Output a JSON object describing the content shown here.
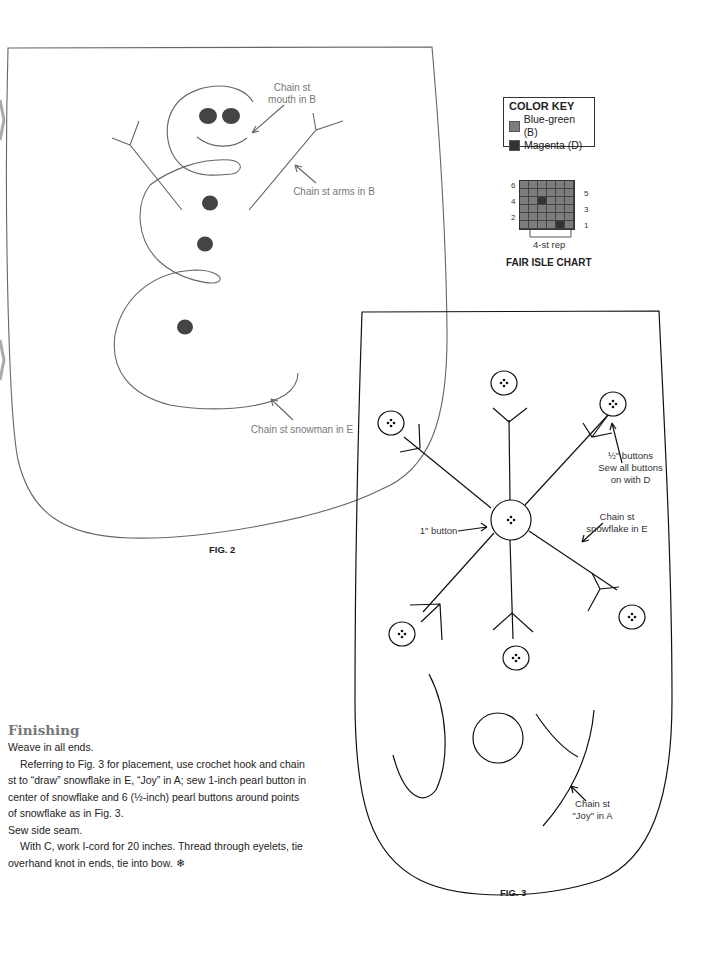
{
  "color_key": {
    "title": "COLOR KEY",
    "items": [
      {
        "label": "Blue-green (B)",
        "color": "#7d7d7d"
      },
      {
        "label": "Magenta (D)",
        "color": "#333333"
      }
    ]
  },
  "fair_isle_chart": {
    "title": "FAIR ISLE CHART",
    "repeat_label": "4-st rep",
    "left_row_numbers": [
      "6",
      "4",
      "2"
    ],
    "right_row_numbers": [
      "5",
      "3",
      "1"
    ],
    "base_color": "#7d7d7d",
    "accent_color": "#333333",
    "grid_cols": 6,
    "grid_rows": 6,
    "accent_cells": [
      [
        2,
        2
      ],
      [
        5,
        4
      ]
    ]
  },
  "fig2": {
    "caption": "FIG. 2",
    "labels": {
      "mouth": "Chain st\nmouth in B",
      "arms": "Chain st arms in B",
      "snowman": "Chain st snowman in E"
    }
  },
  "fig3": {
    "caption": "FIG. 3",
    "labels": {
      "half_buttons": "½\" buttons\nSew all buttons\non with D",
      "one_inch_button": "1\" button",
      "snowflake": "Chain st\nsnowflake in E",
      "joy": "Chain st\n\"Joy\" in A"
    }
  },
  "finishing": {
    "heading": "Finishing",
    "paragraphs": [
      "Weave in all ends.",
      "Referring to Fig. 3 for placement, use crochet hook and chain st to “draw” snowflake in E, “Joy” in A; sew 1-inch pearl button in center of snowflake and 6 (½-inch) pearl buttons around points of snowflake as in Fig. 3.",
      "Sew side seam.",
      "With C, work I-cord for 20 inches. Thread through eyelets, tie overhand knot in ends, tie into bow. ❄"
    ]
  }
}
